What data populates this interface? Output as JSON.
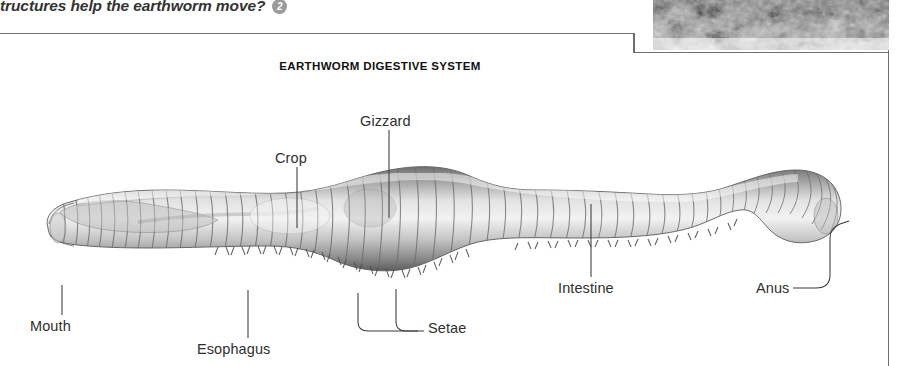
{
  "page": {
    "question_text": "tructures help the earthworm move?",
    "question_badge": "2",
    "background_color": "#ffffff",
    "frame_color": "#6f6f6f"
  },
  "photo": {
    "name": "soil-photograph",
    "description": "grayscale close-up photograph of soil",
    "tone_dark": "#2e2e2e",
    "tone_light": "#d8d8d8"
  },
  "diagram": {
    "title": "EARTHWORM DIGESTIVE SYSTEM",
    "subject": "earthworm",
    "style": "grayscale pencil illustration",
    "labels": [
      {
        "id": "gizzard",
        "text": "Gizzard"
      },
      {
        "id": "crop",
        "text": "Crop"
      },
      {
        "id": "mouth",
        "text": "Mouth"
      },
      {
        "id": "esophagus",
        "text": "Esophagus"
      },
      {
        "id": "setae",
        "text": "Setae"
      },
      {
        "id": "intestine",
        "text": "Intestine"
      },
      {
        "id": "anus",
        "text": "Anus"
      }
    ]
  }
}
